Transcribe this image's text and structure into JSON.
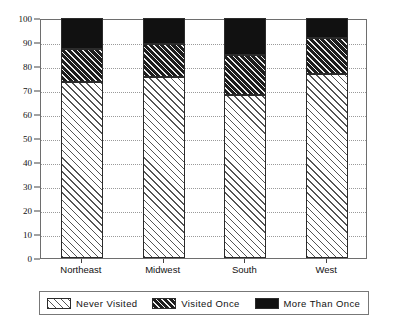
{
  "chart_data": {
    "type": "bar",
    "subtype": "stacked-bar-100",
    "title": "",
    "xlabel": "",
    "ylabel": "",
    "ylim": [
      0,
      100
    ],
    "yticks": [
      0,
      10,
      20,
      30,
      40,
      50,
      60,
      70,
      80,
      90,
      100
    ],
    "ytick_labels": [
      "0",
      "10",
      "20",
      "30",
      "40",
      "50",
      "60",
      "70",
      "80",
      "90",
      "100"
    ],
    "grid": true,
    "legend_position": "bottom",
    "categories": [
      "Northeast",
      "Midwest",
      "South",
      "West"
    ],
    "series": [
      {
        "name": "Never Visited",
        "pattern": "light-diagonal-hatch",
        "color": "#ffffff",
        "values": [
          73.5,
          75.5,
          68.0,
          76.5
        ]
      },
      {
        "name": "Visited Once",
        "pattern": "dense-dark-diagonal-hatch",
        "color": "#4a4a4a",
        "values": [
          13.5,
          13.5,
          16.5,
          15.0
        ]
      },
      {
        "name": "More Than Once",
        "pattern": "solid",
        "color": "#111111",
        "values": [
          13.0,
          11.0,
          15.5,
          8.5
        ]
      }
    ],
    "cumulative_tops": [
      [
        73.5,
        87.0,
        100
      ],
      [
        75.5,
        89.0,
        100
      ],
      [
        68.0,
        84.5,
        100
      ],
      [
        76.5,
        91.5,
        100
      ]
    ]
  },
  "legend": {
    "items": [
      {
        "label": "Never Visited",
        "swatch": "light-diagonal-hatch"
      },
      {
        "label": "Visited Once",
        "swatch": "dense-dark-diagonal-hatch"
      },
      {
        "label": "More Than Once",
        "swatch": "solid-black"
      }
    ]
  }
}
